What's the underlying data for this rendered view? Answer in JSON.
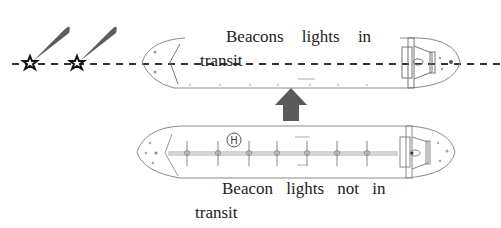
{
  "diagram": {
    "top_ship": {
      "caption_line1": "Beacons lights in",
      "caption_line2": "transit",
      "state": "in transit"
    },
    "bottom_ship": {
      "caption_line1": "Beacon lights not in",
      "caption_line2": "transit",
      "state": "not in transit",
      "deck_marking": "H"
    },
    "beacons": [
      {
        "name": "beacon-1",
        "x": 30,
        "y": 64
      },
      {
        "name": "beacon-2",
        "x": 77,
        "y": 64
      }
    ],
    "arrow": {
      "direction": "up",
      "color": "#5a5a5a"
    },
    "colors": {
      "outline": "#8a8a8a",
      "beam": "#5c5c5c",
      "text": "#222222",
      "deck_line": "#c8c8c8"
    }
  }
}
